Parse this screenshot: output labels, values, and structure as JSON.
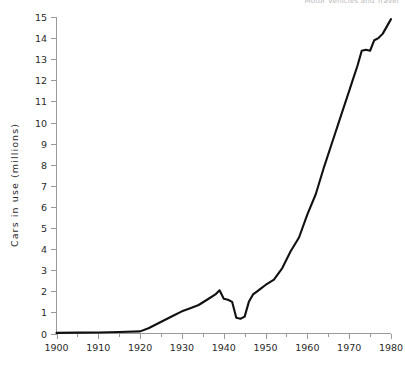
{
  "header": {
    "clipped_text": "Motor Vehicles and Travel"
  },
  "chart_data": {
    "type": "line",
    "title": "",
    "xlabel": "",
    "ylabel": "Cars in use (millions)",
    "xlim": [
      1900,
      1980
    ],
    "ylim": [
      0,
      15
    ],
    "grid": false,
    "legend": "none",
    "line_color": "#111111",
    "axis_color": "#9a9a9a",
    "x_ticks": [
      1900,
      1910,
      1920,
      1930,
      1940,
      1950,
      1960,
      1970,
      1980
    ],
    "x_tick_labels": [
      "1900",
      "1910",
      "1920",
      "1930",
      "1940",
      "1950",
      "1960",
      "1970",
      "1980"
    ],
    "x_minor_tick_step": 5,
    "y_ticks": [
      0,
      1,
      2,
      3,
      4,
      5,
      6,
      7,
      8,
      9,
      10,
      11,
      12,
      13,
      14,
      15
    ],
    "y_tick_labels": [
      "0",
      "1",
      "2",
      "3",
      "4",
      "5",
      "6",
      "7",
      "8",
      "9",
      "10",
      "11",
      "12",
      "13",
      "14",
      "15"
    ],
    "series": [
      {
        "name": "Cars in use",
        "x": [
          1900,
          1905,
          1910,
          1915,
          1920,
          1922,
          1924,
          1926,
          1928,
          1930,
          1932,
          1934,
          1936,
          1938,
          1939,
          1940,
          1941,
          1942,
          1943,
          1944,
          1945,
          1946,
          1947,
          1948,
          1949,
          1950,
          1952,
          1954,
          1956,
          1958,
          1960,
          1962,
          1964,
          1966,
          1968,
          1970,
          1971,
          1972,
          1973,
          1974,
          1975,
          1976,
          1977,
          1978,
          1980
        ],
        "values": [
          0.03,
          0.04,
          0.05,
          0.07,
          0.1,
          0.25,
          0.45,
          0.65,
          0.85,
          1.05,
          1.2,
          1.35,
          1.6,
          1.85,
          2.05,
          1.65,
          1.6,
          1.5,
          0.75,
          0.7,
          0.8,
          1.5,
          1.85,
          2.0,
          2.15,
          2.3,
          2.55,
          3.1,
          3.9,
          4.55,
          5.65,
          6.6,
          7.9,
          9.1,
          10.3,
          11.5,
          12.1,
          12.7,
          13.4,
          13.45,
          13.4,
          13.9,
          14.0,
          14.2,
          14.9
        ]
      }
    ]
  }
}
